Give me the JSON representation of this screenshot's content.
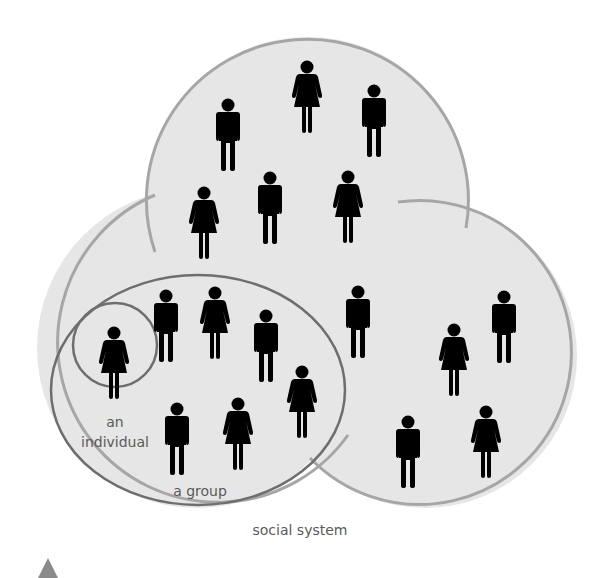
{
  "diagram": {
    "labels": {
      "individual_line1": "an",
      "individual_line2": "individual",
      "group": "a group",
      "system": "social system"
    },
    "colors": {
      "fill": "#e6e6e6",
      "outer_stroke": "#a6a6a6",
      "inner_stroke": "#6e6e6e",
      "figure": "#000000",
      "marker": "#8a8a8a"
    },
    "regions": {
      "top_circle": [
        "man",
        "woman",
        "man",
        "woman",
        "man",
        "woman"
      ],
      "middle": [
        "man"
      ],
      "group": [
        "man",
        "woman",
        "man",
        "woman",
        "man",
        "woman"
      ],
      "individual": [
        "woman"
      ],
      "right_circle": [
        "woman",
        "man",
        "man",
        "woman"
      ]
    }
  }
}
